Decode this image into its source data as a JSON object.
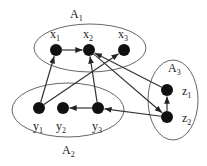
{
  "diagram": {
    "groups": [
      {
        "id": "A1",
        "label": "A",
        "sub": "1",
        "cx": 90,
        "cy": 48,
        "rx": 56,
        "ry": 24,
        "lx": 70,
        "ly": 18
      },
      {
        "id": "A2",
        "label": "A",
        "sub": "2",
        "cx": 68,
        "cy": 110,
        "rx": 56,
        "ry": 27,
        "lx": 62,
        "ly": 154
      },
      {
        "id": "A3",
        "label": "A",
        "sub": "3",
        "cx": 173,
        "cy": 100,
        "rx": 25,
        "ry": 40,
        "lx": 168,
        "ly": 72
      }
    ],
    "nodes": [
      {
        "id": "x1",
        "label": "x",
        "sub": "1",
        "x": 56,
        "y": 50,
        "lx": 50,
        "ly": 38
      },
      {
        "id": "x2",
        "label": "x",
        "sub": "2",
        "x": 89,
        "y": 50,
        "lx": 83,
        "ly": 38
      },
      {
        "id": "x3",
        "label": "x",
        "sub": "3",
        "x": 124,
        "y": 50,
        "lx": 118,
        "ly": 38
      },
      {
        "id": "y1",
        "label": "y",
        "sub": "1",
        "x": 39,
        "y": 108,
        "lx": 33,
        "ly": 130
      },
      {
        "id": "y2",
        "label": "y",
        "sub": "2",
        "x": 63,
        "y": 108,
        "lx": 56,
        "ly": 130
      },
      {
        "id": "y3",
        "label": "y",
        "sub": "3",
        "x": 98,
        "y": 108,
        "lx": 92,
        "ly": 130
      },
      {
        "id": "z1",
        "label": "z",
        "sub": "1",
        "x": 167,
        "y": 90,
        "lx": 182,
        "ly": 95
      },
      {
        "id": "z2",
        "label": "z",
        "sub": "2",
        "x": 167,
        "y": 117,
        "lx": 182,
        "ly": 122
      }
    ],
    "edges": [
      {
        "from": "x1",
        "to": "x2"
      },
      {
        "from": "y1",
        "to": "x1"
      },
      {
        "from": "y1",
        "to": "x3"
      },
      {
        "from": "y3",
        "to": "x2"
      },
      {
        "from": "y3",
        "to": "y2"
      },
      {
        "from": "z2",
        "to": "y3"
      },
      {
        "from": "z1",
        "to": "x2"
      },
      {
        "from": "x2",
        "to": "z2"
      },
      {
        "from": "z2",
        "to": "z1"
      }
    ],
    "style": {
      "node_color": "#111111",
      "edge_color": "#333333",
      "group_stroke": "#555555",
      "node_radius": 6
    }
  }
}
